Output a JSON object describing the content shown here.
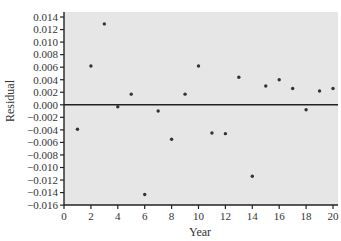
{
  "chart_data": {
    "type": "scatter",
    "title": "",
    "xlabel": "Year",
    "ylabel": "Residual",
    "xlim": [
      0,
      20.3
    ],
    "ylim": [
      -0.016,
      0.0148
    ],
    "xticks": [
      0,
      2,
      4,
      6,
      8,
      10,
      12,
      14,
      16,
      18,
      20
    ],
    "yticks": [
      0.014,
      0.012,
      0.01,
      0.008,
      0.006,
      0.004,
      0.002,
      0.0,
      -0.002,
      -0.004,
      -0.006,
      -0.008,
      -0.01,
      -0.012,
      -0.014,
      -0.016
    ],
    "ytick_labels": [
      "0.014",
      "0.012",
      "0.010",
      "0.008",
      "0.006",
      "0.004",
      "0.002",
      "0.000",
      "−0.002",
      "−0.004",
      "−0.006",
      "−0.008",
      "−0.010",
      "−0.012",
      "−0.014",
      "−0.016"
    ],
    "grid": false,
    "reference_line": {
      "y": 0.0
    },
    "x": [
      1,
      2,
      3,
      4,
      5,
      6,
      7,
      8,
      9,
      10,
      11,
      12,
      13,
      14,
      15,
      16,
      17,
      18,
      19,
      20
    ],
    "y": [
      -0.0039,
      0.0062,
      0.0129,
      -0.0003,
      0.0017,
      -0.0143,
      -0.001,
      -0.0055,
      0.0017,
      0.0062,
      -0.0045,
      -0.0046,
      0.0044,
      -0.0114,
      0.003,
      0.004,
      0.0026,
      -0.0008,
      0.0022,
      0.0026
    ],
    "colors": {
      "plot_background": "#e6e6e6",
      "points": "#333333",
      "axes": "#222222",
      "reference_line": "#222222"
    }
  }
}
